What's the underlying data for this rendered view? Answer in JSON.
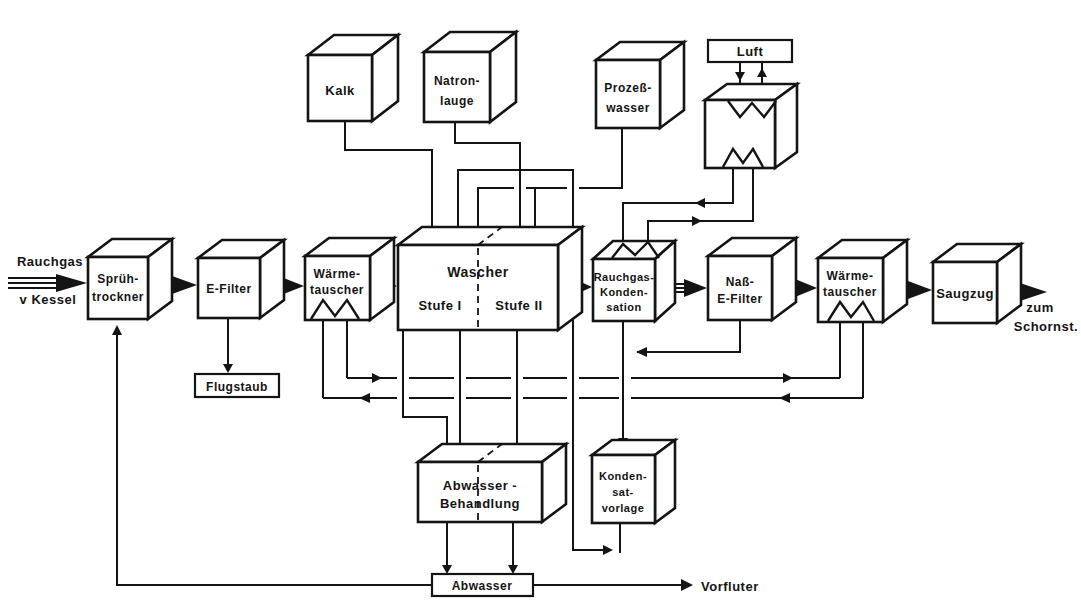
{
  "meta": {
    "background": "#ffffff",
    "ink": "#141414"
  },
  "source": {
    "line1": "Rauchgas",
    "line2": "v Kessel"
  },
  "sink": {
    "line1": "zum",
    "line2": "Schornst."
  },
  "boxes": {
    "spruehtrockner": {
      "line1": "Sprüh-",
      "line2": "trockner"
    },
    "efilter": {
      "line1": "E-Filter"
    },
    "waermetauscher1": {
      "line1": "Wärme-",
      "line2": "tauscher"
    },
    "wascher": {
      "title": "Wascher",
      "stage1": "Stufe I",
      "stage2": "Stufe II"
    },
    "rauchgaskondensation": {
      "line1": "Rauchgas-",
      "line2": "Konden-",
      "line3": "sation"
    },
    "nassefilter": {
      "line1": "Naß-",
      "line2": "E-Filter"
    },
    "waermetauscher2": {
      "line1": "Wärme-",
      "line2": "tauscher"
    },
    "saugzug": {
      "line1": "Saugzug"
    },
    "kalk": {
      "line1": "Kalk"
    },
    "natronlauge": {
      "line1": "Natron-",
      "line2": "lauge"
    },
    "prozesswasser": {
      "line1": "Prozeß-",
      "line2": "wasser"
    },
    "abwasserbehandlung": {
      "line1": "Abwasser -",
      "line2": "Behandlung"
    },
    "kondensatvorlage": {
      "line1": "Konden-",
      "line2": "sat-",
      "line3": "vorlage"
    }
  },
  "tags": {
    "luft": "Luft",
    "flugstaub": "Flugstaub",
    "abwasser": "Abwasser",
    "vorfluter": "Vorfluter"
  }
}
